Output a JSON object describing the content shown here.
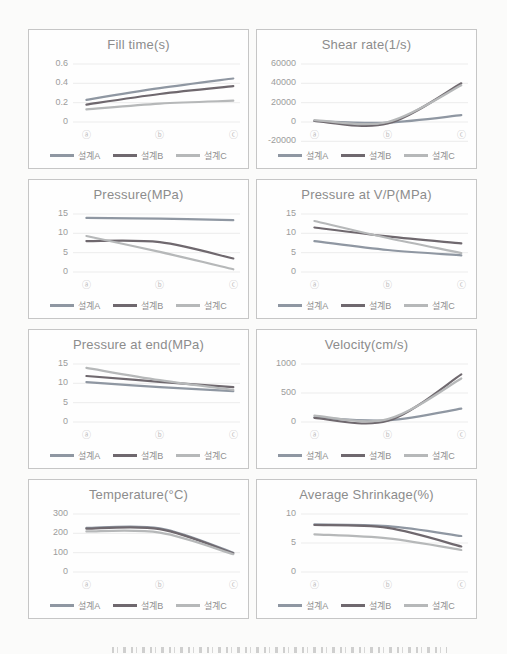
{
  "page": {
    "background": "#fbfbfa",
    "panel_border_color": "#c6c6c6",
    "gridline_color": "#ececec",
    "title_color": "#8c8c8c",
    "tick_color": "#9c9c9c",
    "xlabel_color": "#bdbdbd",
    "legend_text_color": "#8f8f8f"
  },
  "series_colors": {
    "설계A": "#8f97a2",
    "설계B": "#6f686e",
    "설계C": "#b6b8b9"
  },
  "chart_data": [
    {
      "type": "line",
      "title": "Fill time(s)",
      "categories": [
        "ⓐ",
        "ⓑ",
        "ⓒ"
      ],
      "yticks": [
        0,
        0.2,
        0.4,
        0.6
      ],
      "ylim": [
        0,
        0.6
      ],
      "grid": true,
      "legend_position": "bottom",
      "series": [
        {
          "name": "설계A",
          "values": [
            0.23,
            0.35,
            0.45
          ]
        },
        {
          "name": "설계B",
          "values": [
            0.18,
            0.29,
            0.37
          ]
        },
        {
          "name": "설계C",
          "values": [
            0.13,
            0.19,
            0.22
          ]
        }
      ]
    },
    {
      "type": "line",
      "title": "Shear rate(1/s)",
      "categories": [
        "ⓐ",
        "ⓑ",
        "ⓒ"
      ],
      "yticks": [
        -20000,
        0,
        20000,
        40000,
        60000
      ],
      "ylim": [
        -20000,
        60000
      ],
      "grid": true,
      "legend_position": "bottom",
      "series": [
        {
          "name": "설계A",
          "values": [
            1000,
            -500,
            7000
          ]
        },
        {
          "name": "설계B",
          "values": [
            1000,
            -1500,
            40000
          ]
        },
        {
          "name": "설계C",
          "values": [
            2000,
            0,
            38000
          ]
        }
      ]
    },
    {
      "type": "line",
      "title": "Pressure(MPa)",
      "categories": [
        "ⓐ",
        "ⓑ",
        "ⓒ"
      ],
      "yticks": [
        0,
        5,
        10,
        15
      ],
      "ylim": [
        0,
        15
      ],
      "grid": true,
      "legend_position": "bottom",
      "series": [
        {
          "name": "설계A",
          "values": [
            14.0,
            13.8,
            13.4
          ]
        },
        {
          "name": "설계B",
          "values": [
            8.0,
            7.7,
            3.5
          ]
        },
        {
          "name": "설계C",
          "values": [
            9.3,
            5.2,
            0.7
          ]
        }
      ]
    },
    {
      "type": "line",
      "title": "Pressure at V/P(MPa)",
      "categories": [
        "ⓐ",
        "ⓑ",
        "ⓒ"
      ],
      "yticks": [
        0,
        5,
        10,
        15
      ],
      "ylim": [
        0,
        15
      ],
      "grid": true,
      "legend_position": "bottom",
      "series": [
        {
          "name": "설계A",
          "values": [
            8.0,
            5.7,
            4.3
          ]
        },
        {
          "name": "설계B",
          "values": [
            11.5,
            9.2,
            7.4
          ]
        },
        {
          "name": "설계C",
          "values": [
            13.2,
            8.8,
            4.9
          ]
        }
      ]
    },
    {
      "type": "line",
      "title": "Pressure at end(MPa)",
      "categories": [
        "ⓐ",
        "ⓑ",
        "ⓒ"
      ],
      "yticks": [
        0,
        5,
        10,
        15
      ],
      "ylim": [
        0,
        15
      ],
      "grid": true,
      "legend_position": "bottom",
      "series": [
        {
          "name": "설계A",
          "values": [
            10.3,
            9.0,
            8.0
          ]
        },
        {
          "name": "설계B",
          "values": [
            11.9,
            10.4,
            9.0
          ]
        },
        {
          "name": "설계C",
          "values": [
            14.0,
            10.8,
            8.3
          ]
        }
      ]
    },
    {
      "type": "line",
      "title": "Velocity(cm/s)",
      "categories": [
        "ⓐ",
        "ⓑ",
        "ⓒ"
      ],
      "yticks": [
        0,
        500,
        1000
      ],
      "ylim": [
        0,
        1000
      ],
      "grid": true,
      "legend_position": "bottom",
      "series": [
        {
          "name": "설계A",
          "values": [
            80,
            30,
            230
          ]
        },
        {
          "name": "설계B",
          "values": [
            70,
            20,
            820
          ]
        },
        {
          "name": "설계C",
          "values": [
            110,
            50,
            750
          ]
        }
      ]
    },
    {
      "type": "line",
      "title": "Temperature(°C)",
      "categories": [
        "ⓐ",
        "ⓑ",
        "ⓒ"
      ],
      "yticks": [
        0,
        100,
        200,
        300
      ],
      "ylim": [
        0,
        300
      ],
      "grid": true,
      "legend_position": "bottom",
      "series": [
        {
          "name": "설계A",
          "values": [
            228,
            226,
            100
          ]
        },
        {
          "name": "설계B",
          "values": [
            224,
            222,
            97
          ]
        },
        {
          "name": "설계C",
          "values": [
            210,
            204,
            92
          ]
        }
      ]
    },
    {
      "type": "line",
      "title": "Average Shrinkage(%)",
      "categories": [
        "ⓐ",
        "ⓑ",
        "ⓒ"
      ],
      "yticks": [
        0,
        5,
        10
      ],
      "ylim": [
        0,
        10
      ],
      "grid": true,
      "legend_position": "bottom",
      "series": [
        {
          "name": "설계A",
          "values": [
            8.2,
            7.9,
            6.2
          ]
        },
        {
          "name": "설계B",
          "values": [
            8.1,
            7.6,
            4.4
          ]
        },
        {
          "name": "설계C",
          "values": [
            6.5,
            5.8,
            3.8
          ]
        }
      ]
    }
  ]
}
